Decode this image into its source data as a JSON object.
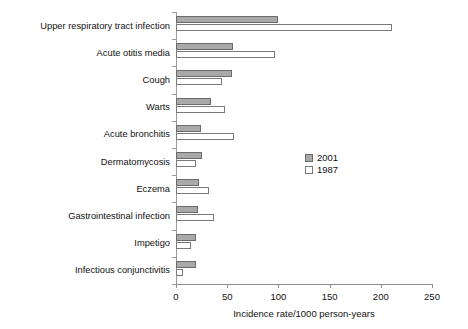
{
  "chart_data": {
    "type": "bar",
    "orientation": "horizontal",
    "title": "",
    "xlabel": "Incidence rate/1000 person-years",
    "ylabel": "",
    "xlim": [
      0,
      250
    ],
    "xticks": [
      0,
      50,
      100,
      150,
      200,
      250
    ],
    "grid": false,
    "legend_position": "center-right",
    "categories": [
      "Upper respiratory tract infection",
      "Acute otitis media",
      "Cough",
      "Warts",
      "Acute bronchitis",
      "Dermatomycosis",
      "Eczema",
      "Gastrointestinal infection",
      "Impetigo",
      "Infectious conjunctivitis"
    ],
    "series": [
      {
        "name": "2001",
        "color": "#a9a9a9",
        "values": [
          100,
          56,
          55,
          34,
          24,
          25,
          22,
          21,
          20,
          20
        ]
      },
      {
        "name": "1987",
        "color": "#ffffff",
        "values": [
          211,
          97,
          45,
          48,
          57,
          20,
          32,
          37,
          15,
          7
        ]
      }
    ]
  },
  "legend": {
    "items": [
      {
        "label": "2001",
        "swatch": "filled-gray-swatch"
      },
      {
        "label": "1987",
        "swatch": "open-white-swatch"
      }
    ]
  }
}
